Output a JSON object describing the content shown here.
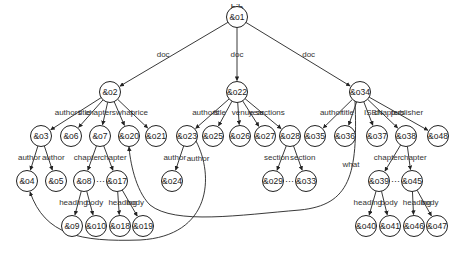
{
  "diagram": {
    "root_label": "bib",
    "nodes": [
      {
        "id": "o1",
        "label": "&o1",
        "x": 237,
        "y": 17
      },
      {
        "id": "o2",
        "label": "&o2",
        "x": 110,
        "y": 92
      },
      {
        "id": "o22",
        "label": "&o22",
        "x": 237,
        "y": 92
      },
      {
        "id": "o34",
        "label": "&o34",
        "x": 360,
        "y": 92
      },
      {
        "id": "o3",
        "label": "&o3",
        "x": 41,
        "y": 136
      },
      {
        "id": "o6",
        "label": "&o6",
        "x": 71,
        "y": 136
      },
      {
        "id": "o7",
        "label": "&o7",
        "x": 100,
        "y": 136
      },
      {
        "id": "o20",
        "label": "&o20",
        "x": 129,
        "y": 136
      },
      {
        "id": "o21",
        "label": "&o21",
        "x": 156,
        "y": 136
      },
      {
        "id": "o23",
        "label": "&o23",
        "x": 187,
        "y": 136
      },
      {
        "id": "o25",
        "label": "&o25",
        "x": 213,
        "y": 136
      },
      {
        "id": "o26",
        "label": "&o26",
        "x": 240,
        "y": 136
      },
      {
        "id": "o27",
        "label": "&o27",
        "x": 265,
        "y": 136
      },
      {
        "id": "o28",
        "label": "&o28",
        "x": 290,
        "y": 136
      },
      {
        "id": "o35",
        "label": "&o35",
        "x": 315,
        "y": 136
      },
      {
        "id": "o36",
        "label": "&o36",
        "x": 345,
        "y": 136
      },
      {
        "id": "o37",
        "label": "&o37",
        "x": 377,
        "y": 136
      },
      {
        "id": "o38",
        "label": "&o38",
        "x": 406,
        "y": 136
      },
      {
        "id": "o48",
        "label": "&o48",
        "x": 438,
        "y": 136
      },
      {
        "id": "o4",
        "label": "&o4",
        "x": 27,
        "y": 181
      },
      {
        "id": "o5",
        "label": "&o5",
        "x": 56,
        "y": 181
      },
      {
        "id": "o8",
        "label": "&o8",
        "x": 84,
        "y": 181
      },
      {
        "id": "o17",
        "label": "&o17",
        "x": 117,
        "y": 181
      },
      {
        "id": "o24",
        "label": "&o24",
        "x": 172,
        "y": 181
      },
      {
        "id": "o29",
        "label": "&o29",
        "x": 273,
        "y": 181
      },
      {
        "id": "o33",
        "label": "&o33",
        "x": 306,
        "y": 181
      },
      {
        "id": "o39",
        "label": "&o39",
        "x": 379,
        "y": 181
      },
      {
        "id": "o45",
        "label": "&o45",
        "x": 412,
        "y": 181
      },
      {
        "id": "o9",
        "label": "&o9",
        "x": 72,
        "y": 226
      },
      {
        "id": "o10",
        "label": "&o10",
        "x": 96,
        "y": 226
      },
      {
        "id": "o18",
        "label": "&o18",
        "x": 120,
        "y": 226
      },
      {
        "id": "o19",
        "label": "&o19",
        "x": 143,
        "y": 226
      },
      {
        "id": "o40",
        "label": "&o40",
        "x": 366,
        "y": 226
      },
      {
        "id": "o41",
        "label": "&o41",
        "x": 390,
        "y": 226
      },
      {
        "id": "o46",
        "label": "&o46",
        "x": 414,
        "y": 226
      },
      {
        "id": "o47",
        "label": "&o47",
        "x": 437,
        "y": 226
      }
    ],
    "edges": [
      {
        "from": "o1",
        "to": "o2",
        "label": "doc"
      },
      {
        "from": "o1",
        "to": "o22",
        "label": "doc"
      },
      {
        "from": "o1",
        "to": "o34",
        "label": "doc"
      },
      {
        "from": "o2",
        "to": "o3",
        "label": "authors"
      },
      {
        "from": "o2",
        "to": "o6",
        "label": "title"
      },
      {
        "from": "o2",
        "to": "o7",
        "label": "chapters"
      },
      {
        "from": "o2",
        "to": "o20",
        "label": "what"
      },
      {
        "from": "o2",
        "to": "o21",
        "label": "price"
      },
      {
        "from": "o22",
        "to": "o23",
        "label": "authors"
      },
      {
        "from": "o22",
        "to": "o25",
        "label": "title"
      },
      {
        "from": "o22",
        "to": "o26",
        "label": "venue"
      },
      {
        "from": "o22",
        "to": "o27",
        "label": "year"
      },
      {
        "from": "o22",
        "to": "o28",
        "label": "sections"
      },
      {
        "from": "o34",
        "to": "o35",
        "label": "author"
      },
      {
        "from": "o34",
        "to": "o36",
        "label": "title"
      },
      {
        "from": "o34",
        "to": "o37",
        "label": "ISBN"
      },
      {
        "from": "o34",
        "to": "o38",
        "label": "chapters"
      },
      {
        "from": "o34",
        "to": "o48",
        "label": "publisher"
      },
      {
        "from": "o3",
        "to": "o4",
        "label": "author"
      },
      {
        "from": "o3",
        "to": "o5",
        "label": "author"
      },
      {
        "from": "o7",
        "to": "o8",
        "label": "chapter"
      },
      {
        "from": "o7",
        "to": "o17",
        "label": "chapter"
      },
      {
        "from": "o23",
        "to": "o24",
        "label": "author"
      },
      {
        "from": "o28",
        "to": "o29",
        "label": "section"
      },
      {
        "from": "o28",
        "to": "o33",
        "label": "section"
      },
      {
        "from": "o38",
        "to": "o39",
        "label": "chapter"
      },
      {
        "from": "o38",
        "to": "o45",
        "label": "chapter"
      },
      {
        "from": "o8",
        "to": "o9",
        "label": "heading"
      },
      {
        "from": "o8",
        "to": "o10",
        "label": "body"
      },
      {
        "from": "o17",
        "to": "o18",
        "label": "heading"
      },
      {
        "from": "o17",
        "to": "o19",
        "label": "body"
      },
      {
        "from": "o39",
        "to": "o40",
        "label": "heading"
      },
      {
        "from": "o39",
        "to": "o41",
        "label": "body"
      },
      {
        "from": "o45",
        "to": "o46",
        "label": "heading"
      },
      {
        "from": "o45",
        "to": "o47",
        "label": "body"
      }
    ],
    "reference_edges": [
      {
        "from": "o23",
        "to": "o4",
        "label": "author"
      },
      {
        "from": "o34",
        "to": "o20",
        "label": "what"
      }
    ],
    "ellipses": [
      {
        "between": [
          "o8",
          "o17"
        ],
        "text": "···"
      },
      {
        "between": [
          "o29",
          "o33"
        ],
        "text": "···"
      },
      {
        "between": [
          "o39",
          "o45"
        ],
        "text": "···"
      }
    ]
  }
}
